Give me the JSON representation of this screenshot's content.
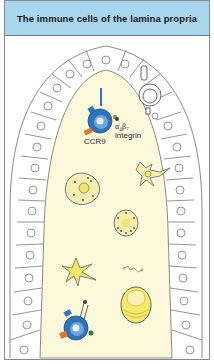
{
  "header": {
    "title": "The immune cells of the lamina propria"
  },
  "labels": {
    "ccr9": "CCR9",
    "integrin_symbol": "α₄β₇",
    "integrin_word": "integrin"
  },
  "colors": {
    "header_bg": "#a9d6ef",
    "lamina_fill": "#fbf8dc",
    "lymphocyte_blue": "#2f74b8",
    "ccr9_orange": "#e0762f",
    "cell_yellow": "#f1e66a",
    "epithelium_stroke": "#8a8a8a"
  }
}
